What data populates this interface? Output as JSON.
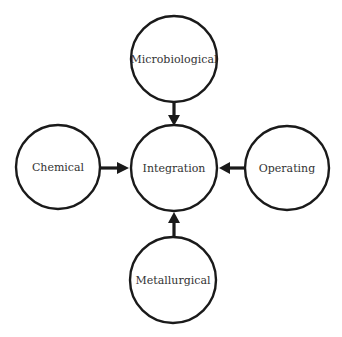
{
  "diagram": {
    "type": "hub-and-spoke",
    "center": {
      "id": "integration",
      "label": "Integration"
    },
    "nodes": [
      {
        "id": "microbiological",
        "label": "Microbiological",
        "position": "top"
      },
      {
        "id": "chemical",
        "label": "Chemical",
        "position": "left"
      },
      {
        "id": "operating",
        "label": "Operating",
        "position": "right"
      },
      {
        "id": "metallurgical",
        "label": "Metallurgical",
        "position": "bottom"
      }
    ],
    "edges": [
      {
        "from": "microbiological",
        "to": "integration"
      },
      {
        "from": "chemical",
        "to": "integration"
      },
      {
        "from": "operating",
        "to": "integration"
      },
      {
        "from": "metallurgical",
        "to": "integration"
      }
    ],
    "colors": {
      "stroke": "#1a1a1a",
      "fill": "#ffffff",
      "text": "#333333"
    }
  }
}
